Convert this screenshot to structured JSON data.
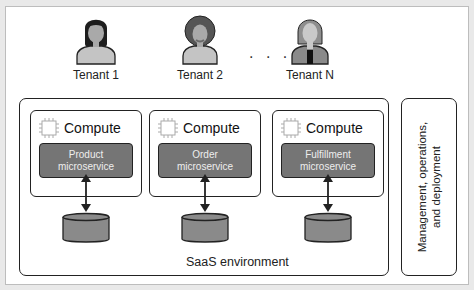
{
  "tenants": [
    {
      "label": "Tenant 1",
      "icon": "female-user-icon"
    },
    {
      "label": "Tenant 2",
      "icon": "male-user-icon"
    },
    {
      "label": "Tenant N",
      "icon": "female-user-icon"
    }
  ],
  "ellipsis": ". . .",
  "saas_environment": {
    "label": "SaaS environment",
    "compute_blocks": [
      {
        "title": "Compute",
        "microservice": "Product\nmicroservice",
        "ms_line1": "Product",
        "ms_line2": "microservice"
      },
      {
        "title": "Compute",
        "microservice": "Order\nmicroservice",
        "ms_line1": "Order",
        "ms_line2": "microservice"
      },
      {
        "title": "Compute",
        "microservice": "Fulfillment\nmicroservice",
        "ms_line1": "Fulfillment",
        "ms_line2": "microservice"
      }
    ]
  },
  "management": {
    "line1": "Management, operations,",
    "line2": "and deployment"
  },
  "colors": {
    "microservice_fill": "#757575",
    "database_fill": "#8a8a8a",
    "person_body": "#b5b5b5",
    "hair_dark": "#1e1e1e",
    "hair_brown": "#5a5a5a"
  }
}
